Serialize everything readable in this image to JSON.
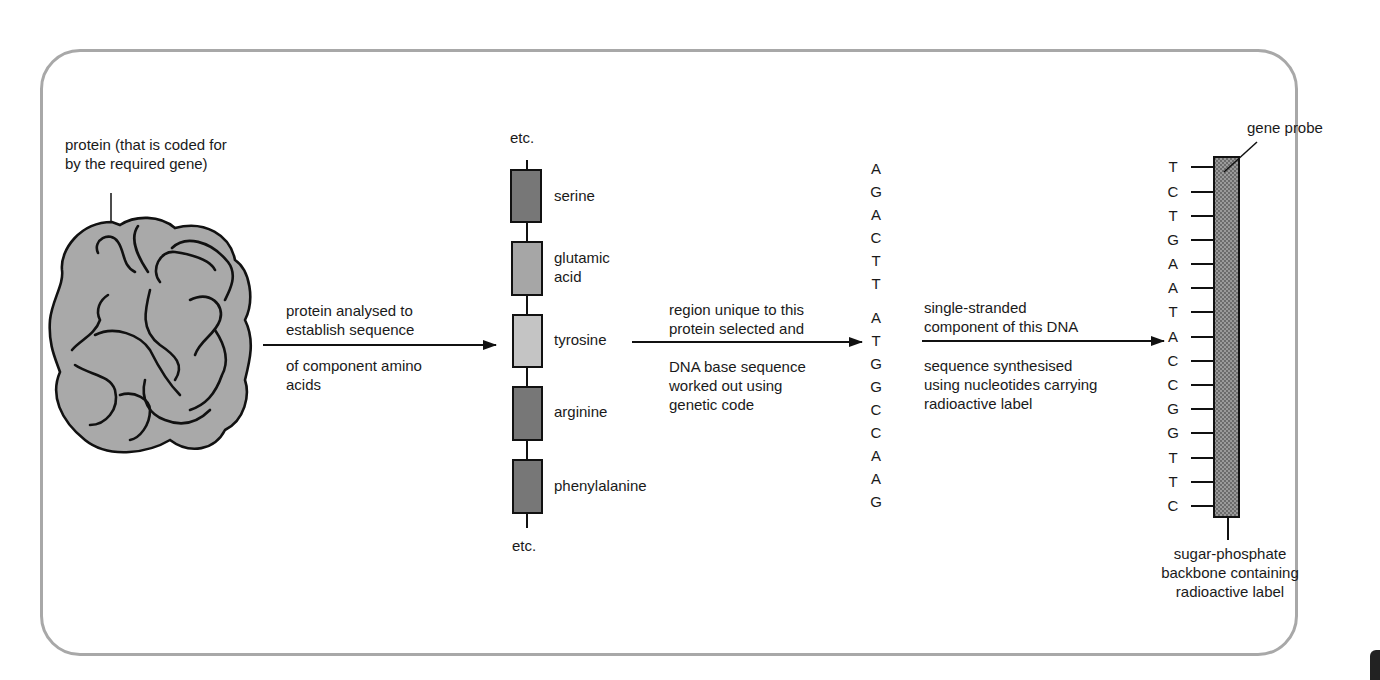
{
  "diagram": {
    "protein": {
      "label_lines": [
        "protein (that is coded for",
        "by the required gene)"
      ],
      "fill": "#a9a9a9"
    },
    "step1_arrow": {
      "above": [
        "protein analysed to",
        "establish sequence"
      ],
      "below": [
        "of component amino",
        "acids"
      ]
    },
    "amino_acid_chain": {
      "top_label": "etc.",
      "bottom_label": "etc.",
      "residues": [
        {
          "name_lines": [
            "serine"
          ],
          "fill": "#777777"
        },
        {
          "name_lines": [
            "glutamic",
            "acid"
          ],
          "fill": "#a6a6a6"
        },
        {
          "name_lines": [
            "tyrosine"
          ],
          "fill": "#c4c4c4"
        },
        {
          "name_lines": [
            "arginine"
          ],
          "fill": "#777777"
        },
        {
          "name_lines": [
            "phenylalanine"
          ],
          "fill": "#777777"
        }
      ]
    },
    "step2_arrow": {
      "above": [
        "region unique to this",
        "protein selected and"
      ],
      "below": [
        "DNA base sequence",
        "worked out using",
        "genetic code"
      ]
    },
    "dna_sequence": [
      "A",
      "G",
      "A",
      "C",
      "T",
      "T",
      "A",
      "T",
      "G",
      "G",
      "C",
      "C",
      "A",
      "A",
      "G"
    ],
    "step3_arrow": {
      "above": [
        "single-stranded",
        "component of this DNA"
      ],
      "below": [
        "sequence synthesised",
        "using nucleotides carrying",
        "radioactive label"
      ]
    },
    "probe": {
      "label": "gene probe",
      "bases": [
        "T",
        "C",
        "T",
        "G",
        "A",
        "A",
        "T",
        "A",
        "C",
        "C",
        "G",
        "G",
        "T",
        "T",
        "C"
      ],
      "backbone_label_lines": [
        "sugar-phosphate",
        "backbone containing",
        "radioactive label"
      ],
      "fill": "#8a8a8a"
    },
    "colors": {
      "frame": "#a8a8a8",
      "line": "#111111",
      "text": "#1a1a1a"
    }
  }
}
